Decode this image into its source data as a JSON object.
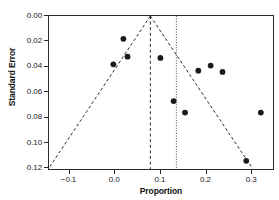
{
  "chart_data": {
    "type": "scatter",
    "title": "",
    "subtitle": "",
    "xlabel": "Proportion",
    "ylabel": "Standard Error",
    "xlim": [
      -0.145,
      0.35
    ],
    "ylim": [
      0.0,
      0.122
    ],
    "y_inverted": true,
    "grid": false,
    "legend": null,
    "legend_position": "none",
    "xticks": [
      -0.1,
      0.0,
      0.1,
      0.2,
      0.3
    ],
    "xticklabels": [
      "−0.1",
      "0.0",
      "0.1",
      "0.2",
      "0.3"
    ],
    "yticks": [
      0.0,
      0.02,
      0.04,
      0.06,
      0.08,
      0.1,
      0.12
    ],
    "yticklabels": [
      "0.00",
      "0.02",
      "0.04",
      "0.06",
      "0.08",
      "0.10",
      "0.12"
    ],
    "series": [
      {
        "name": "studies",
        "marker": "filled-circle",
        "color": "#1a1a1a",
        "points": [
          {
            "x": 0.018,
            "y": 0.018
          },
          {
            "x": 0.027,
            "y": 0.032
          },
          {
            "x": -0.004,
            "y": 0.038
          },
          {
            "x": 0.099,
            "y": 0.033
          },
          {
            "x": 0.128,
            "y": 0.067
          },
          {
            "x": 0.153,
            "y": 0.076
          },
          {
            "x": 0.182,
            "y": 0.043
          },
          {
            "x": 0.209,
            "y": 0.039
          },
          {
            "x": 0.235,
            "y": 0.044
          },
          {
            "x": 0.287,
            "y": 0.114
          },
          {
            "x": 0.319,
            "y": 0.076
          }
        ]
      }
    ],
    "annotations": {
      "center_line": {
        "name": "pooled-effect-line",
        "x": 0.077,
        "style": "dashed",
        "color": "#2b2b2b"
      },
      "reference_line": {
        "name": "null-reference-line",
        "x": 0.134,
        "style": "dotted",
        "color": "#555555"
      },
      "funnel": {
        "name": "pseudo-95pct-confidence-limits",
        "apex_x": 0.077,
        "apex_y": 0.0,
        "left_base_x": -0.143,
        "right_base_x": 0.298,
        "base_y": 0.1185,
        "style": "dashed",
        "color": "#2b2b2b"
      }
    }
  }
}
